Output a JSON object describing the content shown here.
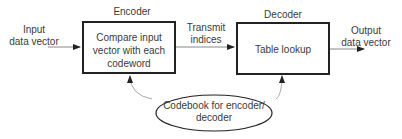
{
  "diagram": {
    "input_label": [
      "Input",
      "data vector"
    ],
    "encoder": {
      "title": "Encoder",
      "text": [
        "Compare input",
        "vector with each",
        "codeword"
      ]
    },
    "transmit_label": [
      "Transmit",
      "indices"
    ],
    "decoder": {
      "title": "Decoder",
      "text": [
        "Table lookup"
      ]
    },
    "output_label": [
      "Output",
      "data vector"
    ],
    "codebook": {
      "text": [
        "Codebook for encoder/",
        "decoder"
      ]
    },
    "colors": {
      "box_border": "#222222",
      "arrow": "#555555",
      "text": "#3a3a3a"
    }
  }
}
